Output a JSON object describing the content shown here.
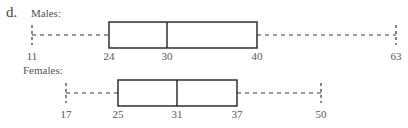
{
  "part_label": "d.",
  "chart_data": {
    "type": "boxplot",
    "title": "",
    "xlabel": "",
    "ylabel": "",
    "grid": false,
    "series": [
      {
        "name": "Males",
        "label": "Males:",
        "min": 11,
        "q1": 24,
        "median": 30,
        "q3": 40,
        "max": 63,
        "tick_labels": [
          "11",
          "24",
          "30",
          "40",
          "63"
        ],
        "px": {
          "min": 32,
          "q1": 109,
          "median": 167,
          "q3": 257,
          "max": 396
        },
        "box_top": 22,
        "box_bottom": 48,
        "whisker_y": 35,
        "label_y": 50
      },
      {
        "name": "Females",
        "label": "Females:",
        "min": 17,
        "q1": 25,
        "median": 31,
        "q3": 37,
        "max": 50,
        "tick_labels": [
          "17",
          "25",
          "31",
          "37",
          "50"
        ],
        "px": {
          "min": 66,
          "q1": 118,
          "median": 177,
          "q3": 237,
          "max": 321
        },
        "box_top": 80,
        "box_bottom": 106,
        "whisker_y": 93,
        "label_y": 108
      }
    ]
  }
}
